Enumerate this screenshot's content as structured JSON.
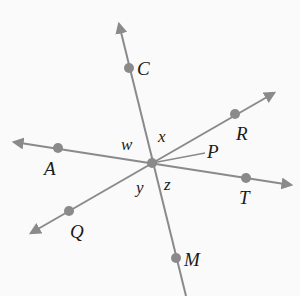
{
  "diagram": {
    "type": "intersecting-lines",
    "line_color": "#8a8a8a",
    "point_color": "#8a8a8a",
    "label_color": "#1a1a1a",
    "background": "#fafafa",
    "center": {
      "x": 152,
      "y": 163
    },
    "lines": [
      {
        "name": "line-CM",
        "through": [
          "C",
          "M"
        ],
        "arrows": "start"
      },
      {
        "name": "line-AT",
        "through": [
          "A",
          "T"
        ],
        "arrows": "both"
      },
      {
        "name": "line-QR",
        "through": [
          "Q",
          "R"
        ],
        "arrows": "both"
      }
    ],
    "rays": [
      {
        "name": "ray-P",
        "from": "center",
        "to": "P"
      }
    ],
    "points": {
      "C": {
        "label": "C",
        "x": 129,
        "y": 68
      },
      "M": {
        "label": "M",
        "x": 176,
        "y": 258
      },
      "A": {
        "label": "A",
        "x": 58,
        "y": 148
      },
      "T": {
        "label": "T",
        "x": 246,
        "y": 178
      },
      "R": {
        "label": "R",
        "x": 235,
        "y": 114
      },
      "Q": {
        "label": "Q",
        "x": 69,
        "y": 211
      },
      "P": {
        "label": "P"
      }
    },
    "angles": {
      "w": "w",
      "x": "x",
      "y": "y",
      "z": "z"
    }
  }
}
